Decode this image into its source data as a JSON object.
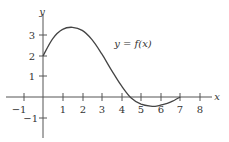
{
  "chart_data": {
    "type": "line",
    "title": "",
    "xlabel": "x",
    "ylabel": "y",
    "xlim": [
      -1.5,
      8.5
    ],
    "ylim": [
      -1.6,
      3.8
    ],
    "grid": false,
    "x_ticks": [
      -1,
      1,
      2,
      3,
      4,
      5,
      6,
      7,
      8
    ],
    "y_ticks": [
      -1,
      1,
      2,
      3
    ],
    "annotation": "y = f(x)",
    "series": [
      {
        "name": "f(x)",
        "x": [
          0,
          0.5,
          1,
          1.5,
          2,
          2.5,
          3,
          3.5,
          4,
          4.5,
          5,
          5.5,
          5.8,
          6,
          6.5,
          7
        ],
        "y": [
          2.0,
          2.85,
          3.3,
          3.4,
          3.25,
          2.8,
          2.1,
          1.3,
          0.55,
          -0.05,
          -0.35,
          -0.45,
          -0.45,
          -0.4,
          -0.25,
          0.0
        ]
      }
    ]
  },
  "labels": {
    "x_axis": "x",
    "y_axis": "y",
    "function": "y = f(x)",
    "x_ticks": [
      "−1",
      "1",
      "2",
      "3",
      "4",
      "5",
      "6",
      "7",
      "8"
    ],
    "y_ticks": [
      "3",
      "2",
      "1",
      "−1"
    ]
  }
}
